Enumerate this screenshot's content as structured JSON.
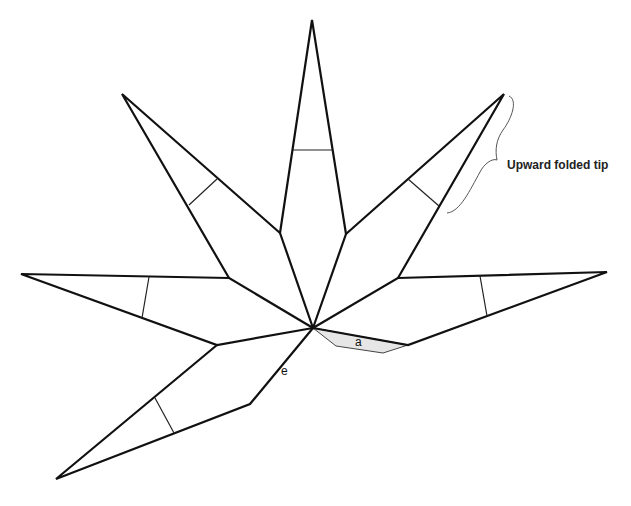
{
  "diagram": {
    "type": "leaf-outline",
    "center": [
      313,
      328
    ],
    "leaflets": [
      {
        "name": "top",
        "tip": [
          312,
          20
        ],
        "corners": [
          [
            280,
            233
          ],
          [
            346,
            234
          ]
        ],
        "cross_line": [
          [
            293,
            150
          ],
          [
            333,
            150
          ]
        ]
      },
      {
        "name": "upper-left",
        "tip": [
          122,
          94
        ],
        "corners": [
          [
            229,
            278
          ],
          [
            280,
            233
          ]
        ],
        "cross_line": [
          [
            189,
            205
          ],
          [
            217,
            179
          ]
        ]
      },
      {
        "name": "upper-right",
        "tip": [
          504,
          94
        ],
        "corners": [
          [
            346,
            234
          ],
          [
            398,
            278
          ]
        ],
        "cross_line": [
          [
            408,
            179
          ],
          [
            439,
            206
          ]
        ]
      },
      {
        "name": "left",
        "tip": [
          21,
          274
        ],
        "corners": [
          [
            229,
            278
          ],
          [
            217,
            345
          ]
        ],
        "cross_line": [
          [
            149,
            277
          ],
          [
            142,
            318
          ]
        ]
      },
      {
        "name": "right",
        "tip": [
          607,
          272
        ],
        "corners": [
          [
            398,
            278
          ],
          [
            408,
            345
          ]
        ],
        "cross_line": [
          [
            480,
            276
          ],
          [
            487,
            316
          ]
        ]
      },
      {
        "name": "lower-left",
        "tip": [
          56,
          479
        ],
        "corners": [
          [
            217,
            345
          ],
          [
            250,
            404
          ]
        ],
        "cross_line": [
          [
            155,
            398
          ],
          [
            174,
            433
          ]
        ]
      }
    ],
    "shaded_region": {
      "label": "a",
      "fill": "#e6e6e6",
      "points": [
        [
          313,
          328
        ],
        [
          408,
          345
        ],
        [
          383,
          353
        ],
        [
          336,
          346
        ]
      ]
    },
    "labels": {
      "a": "a",
      "e": "e",
      "annotation": "Upward folded tip"
    },
    "colors": {
      "stroke": "#111111",
      "shade": "#e6e6e6",
      "background": "#ffffff"
    }
  }
}
